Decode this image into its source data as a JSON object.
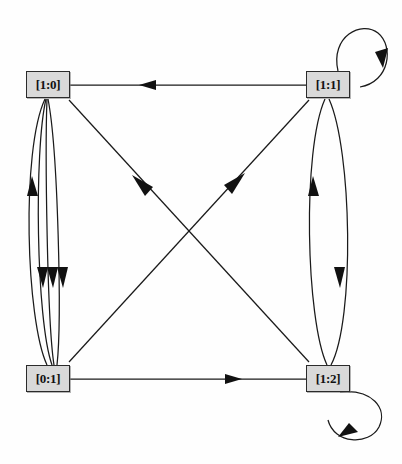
{
  "diagram": {
    "type": "directed-multigraph",
    "background_color": "#fefefe",
    "node_fill_color": "#d9d9d9",
    "node_border_color": "#2b2b2b",
    "edge_color": "#1a1a1a",
    "label_color": "#111111"
  },
  "nodes": [
    {
      "id": "n0",
      "label": "[1:0]",
      "x": 26,
      "y": 71,
      "w": 44,
      "h": 27,
      "position": "top-left"
    },
    {
      "id": "n1",
      "label": "[1:1]",
      "x": 306,
      "y": 71,
      "w": 44,
      "h": 27,
      "position": "top-right"
    },
    {
      "id": "n2",
      "label": "[0:1]",
      "x": 26,
      "y": 365,
      "w": 44,
      "h": 27,
      "position": "bottom-left"
    },
    {
      "id": "n3",
      "label": "[1:2]",
      "x": 306,
      "y": 365,
      "w": 44,
      "h": 27,
      "position": "bottom-right"
    }
  ],
  "edges": [
    {
      "id": "e1",
      "from": "[1:1]",
      "to": "[1:0]",
      "kind": "straight",
      "route": "top",
      "arrow_at": {
        "x": 148,
        "y": 85
      }
    },
    {
      "id": "e2",
      "from": "[0:1]",
      "to": "[1:2]",
      "kind": "straight",
      "route": "bottom",
      "arrow_at": {
        "x": 233,
        "y": 379
      }
    },
    {
      "id": "e3",
      "from": "[0:1]",
      "to": "[1:0]",
      "kind": "curved",
      "route": "left-bundle-1",
      "arrow_at": {
        "x": 33,
        "y": 186
      }
    },
    {
      "id": "e4",
      "from": "[1:0]",
      "to": "[0:1]",
      "kind": "curved",
      "route": "left-bundle-2",
      "arrow_at": {
        "x": 43,
        "y": 277
      }
    },
    {
      "id": "e5",
      "from": "[1:0]",
      "to": "[0:1]",
      "kind": "curved",
      "route": "left-bundle-3",
      "arrow_at": {
        "x": 53,
        "y": 277
      }
    },
    {
      "id": "e6",
      "from": "[1:0]",
      "to": "[0:1]",
      "kind": "curved",
      "route": "left-bundle-4",
      "arrow_at": {
        "x": 63,
        "y": 277
      }
    },
    {
      "id": "e7",
      "from": "[1:2]",
      "to": "[1:1]",
      "kind": "curved",
      "route": "right-bundle-1",
      "arrow_at": {
        "x": 313,
        "y": 186
      }
    },
    {
      "id": "e8",
      "from": "[1:1]",
      "to": "[1:2]",
      "kind": "curved",
      "route": "right-bundle-2",
      "arrow_at": {
        "x": 340,
        "y": 277
      }
    },
    {
      "id": "e9",
      "from": "[1:2]",
      "to": "[1:0]",
      "kind": "diagonal",
      "route": "rising-left",
      "arrow_at": {
        "x": 139,
        "y": 183
      }
    },
    {
      "id": "e10",
      "from": "[0:1]",
      "to": "[1:1]",
      "kind": "diagonal",
      "route": "rising-right",
      "arrow_at": {
        "x": 236,
        "y": 181
      }
    },
    {
      "id": "e11",
      "from": "[1:1]",
      "to": "[1:1]",
      "kind": "self-loop",
      "route": "upper-right",
      "arrow_at": {
        "x": 377,
        "y": 62
      }
    },
    {
      "id": "e12",
      "from": "[1:2]",
      "to": "[1:2]",
      "kind": "self-loop",
      "route": "lower-right",
      "arrow_at": {
        "x": 349,
        "y": 432
      }
    }
  ]
}
